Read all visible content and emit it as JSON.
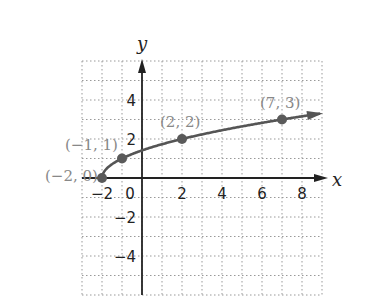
{
  "chart_data": {
    "type": "line",
    "title": "",
    "xlabel": "x",
    "ylabel": "y",
    "xlim": [
      -3,
      9
    ],
    "ylim": [
      -6,
      6
    ],
    "grid": true,
    "x_ticks": [
      -2,
      0,
      2,
      4,
      6,
      8
    ],
    "y_ticks": [
      4,
      2,
      -2,
      -4
    ],
    "x_tick_labels": [
      "−2",
      "0",
      "2",
      "4",
      "6",
      "8"
    ],
    "y_tick_labels": [
      "4",
      "2",
      "−2",
      "−4"
    ],
    "series": [
      {
        "name": "y = sqrt(x + 2)",
        "points": [
          {
            "x": -2,
            "y": 0,
            "label": "(−2, 0)"
          },
          {
            "x": -1,
            "y": 1,
            "label": "(−1, 1)"
          },
          {
            "x": 2,
            "y": 2,
            "label": "(2, 2)"
          },
          {
            "x": 7,
            "y": 3,
            "label": "(7, 3)"
          }
        ],
        "curve_end_x": 8.9,
        "color": "#555555"
      }
    ]
  }
}
